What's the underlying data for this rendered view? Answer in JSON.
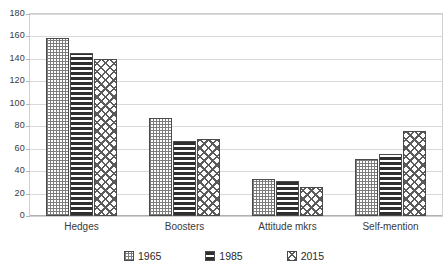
{
  "chart_data": {
    "type": "bar",
    "title": "",
    "subtitle": "",
    "xlabel": "",
    "ylabel": "",
    "categories": [
      "Hedges",
      "Boosters",
      "Attitude mkrs",
      "Self-mention"
    ],
    "series": [
      {
        "name": "1965",
        "values": [
          159,
          87,
          33,
          51
        ],
        "pattern": "dotted"
      },
      {
        "name": "1985",
        "values": [
          145,
          67,
          31,
          55
        ],
        "pattern": "horizontal-lines"
      },
      {
        "name": "2015",
        "values": [
          140,
          69,
          26,
          76
        ],
        "pattern": "diagonal-crosshatch"
      }
    ],
    "ylim": [
      0,
      180
    ],
    "ytick_step": 20,
    "yticks": [
      0,
      20,
      40,
      60,
      80,
      100,
      120,
      140,
      160,
      180
    ],
    "ytick_labels": [
      "0",
      "20",
      "40",
      "60",
      "80",
      "100",
      "120",
      "140",
      "160",
      "180"
    ],
    "grid": true,
    "grid_axis": "y",
    "legend": true,
    "legend_position": "bottom",
    "legend_entries": [
      "1965",
      "1985",
      "2015"
    ],
    "annotations": [],
    "colors": {
      "bar_outline": "#4a4a4a",
      "gridline": "#d9d9d9",
      "axis": "#b0b0b0",
      "text": "#3a3a3a",
      "background": "#ffffff"
    }
  },
  "axes": {
    "y_axis_name": "value-axis",
    "x_axis_name": "category-axis"
  }
}
